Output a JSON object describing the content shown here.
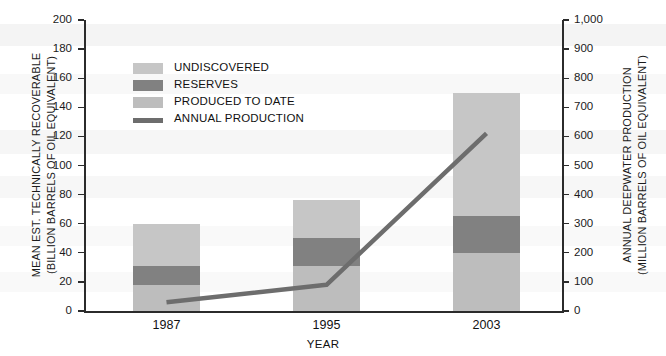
{
  "chart_data": {
    "type": "bar",
    "title": "",
    "subtitle": "",
    "xlabel": "YEAR",
    "ylabel": "MEAN EST. TECHNICALLY RECOVERABLE (BILLION BARRELS OF OIL EQUIVALENT)",
    "y2label": "ANNUAL DEEPWATER PRODUCTION (MILLION BARRELS OF OIL EQUIVALENT)",
    "categories": [
      "1987",
      "1995",
      "2003"
    ],
    "ylim": [
      0,
      200
    ],
    "y2lim": [
      0,
      1000
    ],
    "yticks": [
      0,
      20,
      40,
      60,
      80,
      100,
      120,
      140,
      160,
      180,
      200
    ],
    "ytick_labels": [
      "0",
      "20",
      "40",
      "60",
      "80",
      "100",
      "120",
      "140",
      "160",
      "180",
      "200"
    ],
    "y2ticks": [
      0,
      100,
      200,
      300,
      400,
      500,
      600,
      700,
      800,
      900,
      1000
    ],
    "y2tick_labels": [
      "0",
      "100",
      "200",
      "300",
      "400",
      "500",
      "600",
      "700",
      "800",
      "900",
      "1,000"
    ],
    "grid": false,
    "legend_position": "upper-left",
    "stacked": true,
    "series": [
      {
        "name": "PRODUCED TO DATE",
        "values": [
          18,
          31,
          40
        ],
        "color": "#bdbdbd",
        "kind": "bar"
      },
      {
        "name": "RESERVES",
        "values": [
          13,
          19,
          25
        ],
        "color": "#818181",
        "kind": "bar"
      },
      {
        "name": "UNDISCOVERED",
        "values": [
          29,
          26,
          85
        ],
        "color": "#c6c6c6",
        "kind": "bar"
      }
    ],
    "totals": [
      60,
      76,
      150
    ],
    "line_series": {
      "name": "ANNUAL PRODUCTION",
      "axis": "right",
      "values": [
        30,
        90,
        610
      ],
      "color": "#6d6d6d"
    }
  },
  "legend": {
    "items": [
      {
        "label": "UNDISCOVERED",
        "swatch": "swatch-undiscovered",
        "color": "#c6c6c6",
        "type": "swatch"
      },
      {
        "label": "RESERVES",
        "swatch": "swatch-reserves",
        "color": "#818181",
        "type": "swatch"
      },
      {
        "label": "PRODUCED TO DATE",
        "swatch": "swatch-produced-to-date",
        "color": "#bdbdbd",
        "type": "swatch"
      },
      {
        "label": "ANNUAL PRODUCTION",
        "swatch": "swatch-annual-production",
        "color": "#6d6d6d",
        "type": "line"
      }
    ]
  },
  "axes": {
    "left_title_line1": "MEAN EST. TECHNICALLY RECOVERABLE",
    "left_title_line2": "(BILLION BARRELS OF OIL EQUIVALENT)",
    "right_title_line1": "ANNUAL DEEPWATER PRODUCTION",
    "right_title_line2": "(MILLION BARRELS OF OIL EQUIVALENT)",
    "x_title": "YEAR"
  },
  "colors": {
    "undiscovered": "#c6c6c6",
    "reserves": "#818181",
    "produced": "#bdbdbd",
    "line": "#6d6d6d",
    "axis": "#2b2b2b",
    "text": "#111111",
    "background": "#ffffff"
  }
}
